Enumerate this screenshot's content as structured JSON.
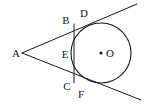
{
  "figure": {
    "type": "geometry-diagram",
    "width": 144,
    "height": 106,
    "background_color": "#ffffff",
    "stroke_color": "#1a1a1a",
    "label_color": "#1a1a1a"
  },
  "circle": {
    "name": "circle-O",
    "center_x": 101,
    "center_y": 53,
    "radius": 30,
    "fill": "none",
    "stroke_width": 1.1
  },
  "center_dot": {
    "name": "center-point-O",
    "x": 101,
    "y": 53,
    "radius": 1.6
  },
  "points": [
    {
      "id": "A",
      "label": "A",
      "label_x": 16,
      "label_y": 53,
      "x": 22,
      "y": 53
    },
    {
      "id": "B",
      "label": "B",
      "label_x": 66,
      "label_y": 20,
      "x": 74,
      "y": 25
    },
    {
      "id": "D",
      "label": "D",
      "label_x": 84,
      "label_y": 13,
      "x": 89,
      "y": 25
    },
    {
      "id": "E",
      "label": "E",
      "label_x": 65,
      "label_y": 54,
      "x": 74,
      "y": 53
    },
    {
      "id": "C",
      "label": "C",
      "label_x": 67,
      "label_y": 86,
      "x": 74,
      "y": 82
    },
    {
      "id": "F",
      "label": "F",
      "label_x": 81,
      "label_y": 94,
      "x": 88,
      "y": 82
    },
    {
      "id": "O",
      "label": "O",
      "label_x": 110,
      "label_y": 53,
      "x": 101,
      "y": 53
    }
  ],
  "segments": [
    {
      "id": "upper-tangent",
      "name": "tangent-line-A-D",
      "x1": 22,
      "y1": 53,
      "x2": 137,
      "y2": 4,
      "stroke_width": 1.0
    },
    {
      "id": "lower-tangent",
      "name": "tangent-line-A-F",
      "x1": 22,
      "y1": 53,
      "x2": 141,
      "y2": 100,
      "stroke_width": 1.0
    },
    {
      "id": "chord-BC",
      "name": "chord-line-B-C",
      "x1": 74,
      "y1": 24,
      "x2": 74,
      "y2": 83,
      "stroke_width": 1.0
    }
  ]
}
